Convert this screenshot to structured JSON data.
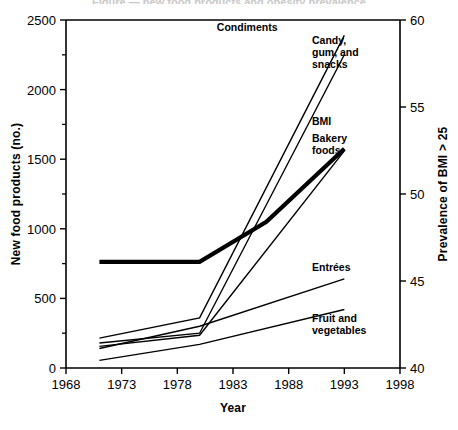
{
  "figure": {
    "cropped_title": "Figure — new food products and obesity prevalence",
    "background": "#ffffff",
    "ink": "#000000"
  },
  "chart_data": {
    "type": "line",
    "title": "",
    "xlabel": "Year",
    "ylabel": "New food products (no.)",
    "y2label": "Prevalence of BMI > 25",
    "xlim": [
      1968,
      1998
    ],
    "ylim": [
      0,
      2500
    ],
    "y2lim": [
      40,
      60
    ],
    "xticks": [
      1968,
      1973,
      1978,
      1983,
      1988,
      1993,
      1998
    ],
    "xticklabels": [
      "1968",
      "1973",
      "1978",
      "1983",
      "1988",
      "1993",
      "1998"
    ],
    "yticks": [
      0,
      500,
      1000,
      1500,
      2000,
      2500
    ],
    "yticklabels": [
      "0",
      "500",
      "1000",
      "1500",
      "2000",
      "2500"
    ],
    "y_minor_ticks": [
      250,
      750,
      1250,
      1750,
      2250
    ],
    "y2ticks": [
      40,
      45,
      50,
      55,
      60
    ],
    "y2ticklabels": [
      "40",
      "45",
      "50",
      "55",
      "60"
    ],
    "grid": false,
    "legend": "inline-end-labels",
    "series": [
      {
        "name": "Condiments",
        "axis": "left",
        "label_x": 1987.0,
        "label_y": 2420,
        "label_anchor": "end",
        "stroke_width": 1.4,
        "x": [
          1971,
          1980,
          1993
        ],
        "values": [
          215,
          360,
          2390
        ]
      },
      {
        "name": "Candy, gum, and snacks",
        "axis": "left",
        "label_x": 1990.1,
        "label_y": 2330,
        "label_anchor": "start",
        "stroke_width": 1.4,
        "x": [
          1971,
          1980,
          1993
        ],
        "values": [
          180,
          250,
          2250
        ]
      },
      {
        "name": "BMI",
        "axis": "right",
        "label_x": 1990.1,
        "label_y": 1745,
        "label_anchor": "start",
        "stroke_width": 4.2,
        "x": [
          1971,
          1980,
          1986,
          1993
        ],
        "values": [
          46.1,
          46.1,
          48.4,
          52.6
        ]
      },
      {
        "name": "Bakery foods",
        "axis": "left",
        "label_x": 1990.1,
        "label_y": 1620,
        "label_anchor": "start",
        "stroke_width": 1.4,
        "x": [
          1971,
          1980,
          1993
        ],
        "values": [
          155,
          235,
          1560
        ]
      },
      {
        "name": "Entrées",
        "axis": "left",
        "label_x": 1990.1,
        "label_y": 700,
        "label_anchor": "start",
        "stroke_width": 1.4,
        "x": [
          1971,
          1980,
          1993
        ],
        "values": [
          140,
          300,
          640
        ]
      },
      {
        "name": "Fruit and vegetables",
        "axis": "left",
        "label_x": 1990.1,
        "label_y": 330,
        "label_anchor": "start",
        "stroke_width": 1.4,
        "x": [
          1971,
          1980,
          1993
        ],
        "values": [
          55,
          170,
          420
        ]
      }
    ]
  }
}
